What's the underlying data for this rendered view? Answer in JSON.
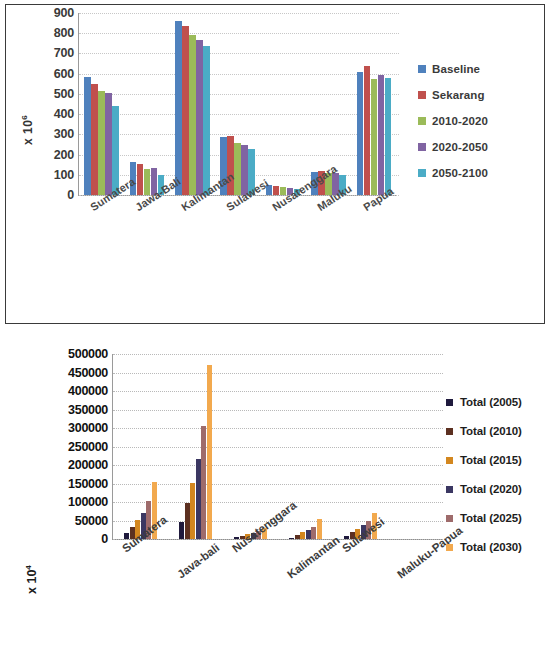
{
  "chart_data": [
    {
      "type": "bar",
      "title": "",
      "xlabel": "",
      "ylabel": "x 10⁶",
      "ylabel_base": "x 10",
      "ylabel_exp": "6",
      "ylim": [
        0,
        900
      ],
      "ytick_step": 100,
      "yticks": [
        "900",
        "800",
        "700",
        "600",
        "500",
        "400",
        "300",
        "200",
        "100",
        "0"
      ],
      "grid": true,
      "legend_position": "right",
      "categories": [
        "Sumatera",
        "Jawa-Bali",
        "Kalimantan",
        "Sulawesi",
        "Nusatenggara",
        "Maluku",
        "Papua"
      ],
      "series": [
        {
          "name": "Baseline",
          "color": "#4f81bd",
          "values": [
            585,
            165,
            862,
            288,
            52,
            115,
            610
          ]
        },
        {
          "name": "Sekarang",
          "color": "#c0504d",
          "values": [
            550,
            152,
            838,
            290,
            46,
            121,
            636
          ]
        },
        {
          "name": "2010-2020",
          "color": "#9bbb59",
          "values": [
            515,
            128,
            790,
            258,
            38,
            108,
            572
          ]
        },
        {
          "name": "2020-2050",
          "color": "#8064a2",
          "values": [
            505,
            135,
            765,
            248,
            35,
            107,
            594
          ]
        },
        {
          "name": "2050-2100",
          "color": "#4bacc6",
          "values": [
            440,
            100,
            738,
            228,
            32,
            100,
            580
          ]
        }
      ]
    },
    {
      "type": "bar",
      "title": "",
      "xlabel": "",
      "ylabel": "x 10⁴",
      "ylabel_base": "x 10",
      "ylabel_exp": "4",
      "ylim": [
        0,
        500000
      ],
      "ytick_step": 50000,
      "yticks": [
        "500000",
        "450000",
        "400000",
        "350000",
        "300000",
        "250000",
        "200000",
        "150000",
        "100000",
        "50000",
        "0"
      ],
      "grid": true,
      "legend_position": "right",
      "categories": [
        "Sumatera",
        "Java-bali",
        "Nusatenggara",
        "Kalimantan",
        "Sulawesi",
        "Maluku-Papua"
      ],
      "series": [
        {
          "name": "Total (2005)",
          "color": "#1f1a3d",
          "values": [
            15000,
            45000,
            5000,
            4000,
            9000,
            0
          ]
        },
        {
          "name": "Total (2010)",
          "color": "#5c3021",
          "values": [
            33000,
            98000,
            9000,
            11000,
            18000,
            0
          ]
        },
        {
          "name": "Total (2015)",
          "color": "#d3871f",
          "values": [
            52000,
            152000,
            13000,
            19000,
            27000,
            0
          ]
        },
        {
          "name": "Total (2020)",
          "color": "#3b3762",
          "values": [
            70000,
            215000,
            17000,
            25000,
            37000,
            0
          ]
        },
        {
          "name": "Total (2025)",
          "color": "#9e6b6b",
          "values": [
            103000,
            305000,
            22000,
            33000,
            50000,
            0
          ]
        },
        {
          "name": "Total (2030)",
          "color": "#f2a94e",
          "values": [
            155000,
            470000,
            30000,
            55000,
            70000,
            0
          ]
        }
      ]
    }
  ]
}
